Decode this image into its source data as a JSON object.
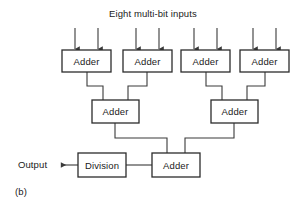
{
  "figure": {
    "caption": "(b)",
    "title": "Eight multi-bit inputs",
    "output_label": "Output",
    "line_color": "#3a3a3a",
    "box_border_color": "#2b2b2b",
    "background_color": "#ffffff",
    "text_color": "#1a1a1a"
  },
  "nodes": {
    "adder_row1": [
      {
        "label": "Adder",
        "x": 62,
        "y": 50,
        "w": 49,
        "h": 22
      },
      {
        "label": "Adder",
        "x": 123,
        "y": 50,
        "w": 49,
        "h": 22
      },
      {
        "label": "Adder",
        "x": 181,
        "y": 50,
        "w": 49,
        "h": 22
      },
      {
        "label": "Adder",
        "x": 240,
        "y": 50,
        "w": 49,
        "h": 22
      }
    ],
    "adder_row2": [
      {
        "label": "Adder",
        "x": 92,
        "y": 100,
        "w": 47,
        "h": 23
      },
      {
        "label": "Adder",
        "x": 211,
        "y": 100,
        "w": 47,
        "h": 23
      }
    ],
    "adder_row3": [
      {
        "label": "Adder",
        "x": 152,
        "y": 153,
        "w": 48,
        "h": 24
      }
    ],
    "division": [
      {
        "label": "Division",
        "x": 78,
        "y": 153,
        "w": 48,
        "h": 24
      }
    ]
  },
  "inputs": {
    "count": 8,
    "arrow_x": [
      75,
      98,
      136,
      159,
      194,
      217,
      253,
      276
    ],
    "arrow_top_y": 28,
    "arrow_bottom_y": 50
  },
  "edges": {
    "row1_to_row2": [
      {
        "from": "adder-1",
        "to": "adder-5",
        "path": "M 87 72 L 87 86 L 103 86 L 103 100"
      },
      {
        "from": "adder-2",
        "to": "adder-5",
        "path": "M 147 72 L 147 86 L 128 86 L 128 100"
      },
      {
        "from": "adder-3",
        "to": "adder-6",
        "path": "M 206 72 L 206 86 L 222 86 L 222 100"
      },
      {
        "from": "adder-4",
        "to": "adder-6",
        "path": "M 265 72 L 265 86 L 247 86 L 247 100"
      }
    ],
    "row2_to_row3": [
      {
        "from": "adder-5",
        "to": "adder-7",
        "path": "M 115 123 L 115 138 L 167 138 L 167 153"
      },
      {
        "from": "adder-6",
        "to": "adder-7",
        "path": "M 234 123 L 234 138 L 185 138 L 185 153"
      }
    ],
    "row3_to_division": [
      {
        "from": "adder-7",
        "to": "division",
        "path": "M 152 165 L 126 165"
      }
    ],
    "division_to_output": [
      {
        "from": "division",
        "to": "output",
        "path": "M 78 165 L 60 165"
      }
    ]
  }
}
